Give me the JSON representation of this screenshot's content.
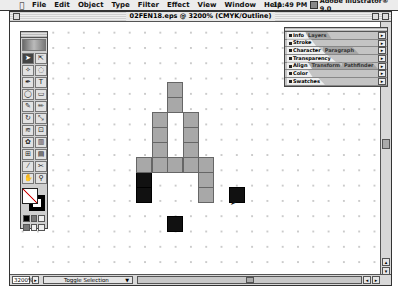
{
  "menubar": {
    "apple_icon": "",
    "items": [
      "File",
      "Edit",
      "Object",
      "Type",
      "Filter",
      "Effect",
      "View",
      "Window",
      "Help"
    ],
    "clock": "11:49 PM",
    "app_name": "Adobe Illustrator® 9.0"
  },
  "window": {
    "title": "02FEN18.eps @ 3200% (CMYK/Outline)"
  },
  "toolbox": {
    "tools": [
      {
        "name": "selection-tool",
        "glyph": "➤",
        "active": true
      },
      {
        "name": "direct-selection-tool",
        "glyph": "⇱"
      },
      {
        "name": "magic-wand-tool",
        "glyph": "✧"
      },
      {
        "name": "lasso-tool",
        "glyph": "◌"
      },
      {
        "name": "pen-tool",
        "glyph": "✒"
      },
      {
        "name": "type-tool",
        "glyph": "T"
      },
      {
        "name": "ellipse-tool",
        "glyph": "◯"
      },
      {
        "name": "rectangle-tool",
        "glyph": "▭"
      },
      {
        "name": "paintbrush-tool",
        "glyph": "✎"
      },
      {
        "name": "pencil-tool",
        "glyph": "✏"
      },
      {
        "name": "rotate-tool",
        "glyph": "↻"
      },
      {
        "name": "scale-tool",
        "glyph": "⤡"
      },
      {
        "name": "warp-tool",
        "glyph": "≋"
      },
      {
        "name": "free-transform-tool",
        "glyph": "⊡"
      },
      {
        "name": "symbol-tool",
        "glyph": "✿"
      },
      {
        "name": "graph-tool",
        "glyph": "▥"
      },
      {
        "name": "mesh-tool",
        "glyph": "⊞"
      },
      {
        "name": "gradient-tool",
        "glyph": "▤"
      },
      {
        "name": "eyedropper-tool",
        "glyph": "⁄"
      },
      {
        "name": "scissors-tool",
        "glyph": "✂"
      },
      {
        "name": "hand-tool",
        "glyph": "✋"
      },
      {
        "name": "zoom-tool",
        "glyph": "⚲"
      }
    ]
  },
  "panel": {
    "rows": [
      {
        "tabs": [
          {
            "label": "Info",
            "active": true
          },
          {
            "label": "Layers",
            "active": false
          }
        ]
      },
      {
        "tabs": [
          {
            "label": "Stroke",
            "active": true
          }
        ]
      },
      {
        "tabs": [
          {
            "label": "Character",
            "active": true
          },
          {
            "label": "Paragraph",
            "active": false
          }
        ]
      },
      {
        "tabs": [
          {
            "label": "Transparency",
            "active": true
          }
        ]
      },
      {
        "tabs": [
          {
            "label": "Align",
            "active": true
          },
          {
            "label": "Transform",
            "active": false
          },
          {
            "label": "Pathfinder",
            "active": false
          }
        ]
      },
      {
        "tabs": [
          {
            "label": "Color",
            "active": true
          }
        ]
      },
      {
        "tabs": [
          {
            "label": "Swatches",
            "active": true
          }
        ]
      }
    ],
    "menu_glyph": "▸"
  },
  "artwork": {
    "colors": {
      "gray": "#a8a8a8",
      "black": "#111111"
    },
    "blocks": [
      {
        "x": 157,
        "y": 60,
        "c": "gray"
      },
      {
        "x": 157,
        "y": 75,
        "c": "gray"
      },
      {
        "x": 142,
        "y": 90,
        "c": "gray"
      },
      {
        "x": 173,
        "y": 90,
        "c": "gray"
      },
      {
        "x": 142,
        "y": 105,
        "c": "gray"
      },
      {
        "x": 173,
        "y": 105,
        "c": "gray"
      },
      {
        "x": 142,
        "y": 120,
        "c": "gray"
      },
      {
        "x": 173,
        "y": 120,
        "c": "gray"
      },
      {
        "x": 126,
        "y": 135,
        "c": "gray"
      },
      {
        "x": 142,
        "y": 135,
        "c": "gray"
      },
      {
        "x": 157,
        "y": 135,
        "c": "gray"
      },
      {
        "x": 173,
        "y": 135,
        "c": "gray"
      },
      {
        "x": 188,
        "y": 135,
        "c": "gray"
      },
      {
        "x": 126,
        "y": 150,
        "c": "black"
      },
      {
        "x": 126,
        "y": 165,
        "c": "black"
      },
      {
        "x": 188,
        "y": 150,
        "c": "gray"
      },
      {
        "x": 188,
        "y": 165,
        "c": "gray"
      },
      {
        "x": 219,
        "y": 165,
        "c": "black"
      },
      {
        "x": 157,
        "y": 194,
        "c": "black"
      }
    ]
  },
  "statusbar": {
    "zoom": "3200%",
    "zoom_arrow": "▸",
    "status_label": "Toggle Selection",
    "dropdown_glyph": "▼",
    "left_arrow": "◂",
    "right_arrow": "▸"
  },
  "scroll": {
    "up_arrow": "▴",
    "down_arrow": "▾"
  }
}
